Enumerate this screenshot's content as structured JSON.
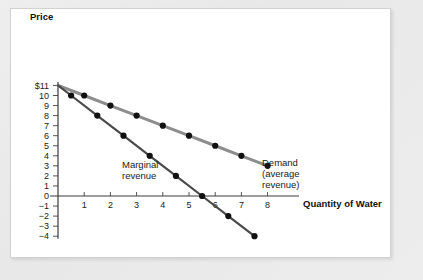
{
  "figure": {
    "background_color": "#ececec",
    "panel_color": "#ffffff",
    "y_axis_title": "Price",
    "x_axis_title": "Quantity of Water"
  },
  "labels": {
    "demand_line1": "Demand",
    "demand_line2": "(average",
    "demand_line3": "revenue)",
    "mr_line1": "Marginal",
    "mr_line2": "revenue"
  },
  "axis": {
    "y_ticks": [
      "$11",
      "10",
      "9",
      "8",
      "7",
      "6",
      "5",
      "4",
      "3",
      "2",
      "1",
      "0",
      "−1",
      "−2",
      "−3",
      "−4"
    ],
    "y_values": [
      11,
      10,
      9,
      8,
      7,
      6,
      5,
      4,
      3,
      2,
      1,
      0,
      -1,
      -2,
      -3,
      -4
    ],
    "x_ticks": [
      "1",
      "2",
      "3",
      "4",
      "5",
      "6",
      "7",
      "8"
    ],
    "x_values": [
      1,
      2,
      3,
      4,
      5,
      6,
      7,
      8
    ]
  },
  "chart_data": {
    "type": "line",
    "title": "",
    "xlabel": "Quantity of Water",
    "ylabel": "Price",
    "xlim": [
      0,
      9.2
    ],
    "ylim": [
      -4,
      11
    ],
    "grid": false,
    "legend": "annotated-inline",
    "series": [
      {
        "name": "Demand (average revenue)",
        "color": "#8d8d8d",
        "marker_color": "#111111",
        "x": [
          0,
          1,
          2,
          3,
          4,
          5,
          6,
          7,
          8
        ],
        "y": [
          11,
          10,
          9,
          8,
          7,
          6,
          5,
          4,
          3
        ],
        "marker_x": [
          1,
          2,
          3,
          4,
          5,
          6,
          7,
          8
        ],
        "marker_y": [
          10,
          9,
          8,
          7,
          6,
          5,
          4,
          3
        ]
      },
      {
        "name": "Marginal revenue",
        "color": "#4a4a4a",
        "marker_color": "#111111",
        "x": [
          0,
          0.5,
          1.5,
          2.5,
          3.5,
          4.5,
          5.5,
          6.5,
          7.5
        ],
        "y": [
          11,
          10,
          8,
          6,
          4,
          2,
          0,
          -2,
          -4
        ],
        "marker_x": [
          0.5,
          1.5,
          2.5,
          3.5,
          4.5,
          5.5,
          6.5,
          7.5
        ],
        "marker_y": [
          10,
          8,
          6,
          4,
          2,
          0,
          -2,
          -4
        ]
      }
    ]
  },
  "geometry": {
    "origin_x": 58,
    "origin_y": 196,
    "x_step": 26.2,
    "y_step": 10.05
  }
}
